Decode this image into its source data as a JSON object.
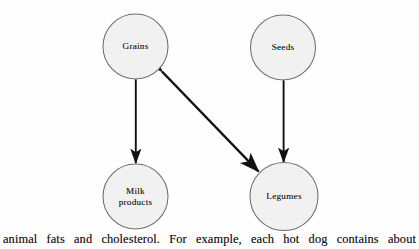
{
  "figure": {
    "title": "",
    "background_color": "#fefefe",
    "node_fill_color": "#f1f1f1",
    "node_stroke_color": "#6e6e6e",
    "arrow_color": "#111111",
    "nodes": [
      {
        "id": "grains",
        "label": "Grains",
        "cx": 135.5,
        "cy": 46.5,
        "r": 32.5
      },
      {
        "id": "seeds",
        "label": "Seeds",
        "cx": 283.0,
        "cy": 47.5,
        "r": 32.5
      },
      {
        "id": "milk-products",
        "label": "Milk\nproducts",
        "cx": 135.5,
        "cy": 196.5,
        "r": 32.5
      },
      {
        "id": "legumes",
        "label": "Legumes",
        "cx": 284.0,
        "cy": 196.5,
        "r": 34.0
      }
    ],
    "edges": [
      {
        "id": "grains-milk",
        "from": "grains",
        "to": "milk-products",
        "arrowheads": "both",
        "x1": 135.8,
        "y1": 80.0,
        "x2": 135.8,
        "y2": 163.0
      },
      {
        "id": "seeds-legumes",
        "from": "seeds",
        "to": "legumes",
        "arrowheads": "both",
        "x1": 283.6,
        "y1": 81.0,
        "x2": 283.6,
        "y2": 162.0
      },
      {
        "id": "grains-legumes",
        "from": "grains",
        "to": "legumes",
        "arrowheads": "both",
        "x1": 162.0,
        "y1": 71.5,
        "x2": 258.5,
        "y2": 171.5
      }
    ]
  },
  "caption": {
    "text": "animal fats and cholesterol. For example, each hot dog contains about"
  }
}
